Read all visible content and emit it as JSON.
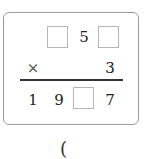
{
  "problem": {
    "multiplicand": {
      "hundreds": "",
      "tens": "5",
      "ones": ""
    },
    "operator": "×",
    "multiplier": "3",
    "product": {
      "thousands": "1",
      "hundreds": "9",
      "tens": "",
      "ones": "7"
    }
  },
  "answer": {
    "open_paren": "("
  }
}
